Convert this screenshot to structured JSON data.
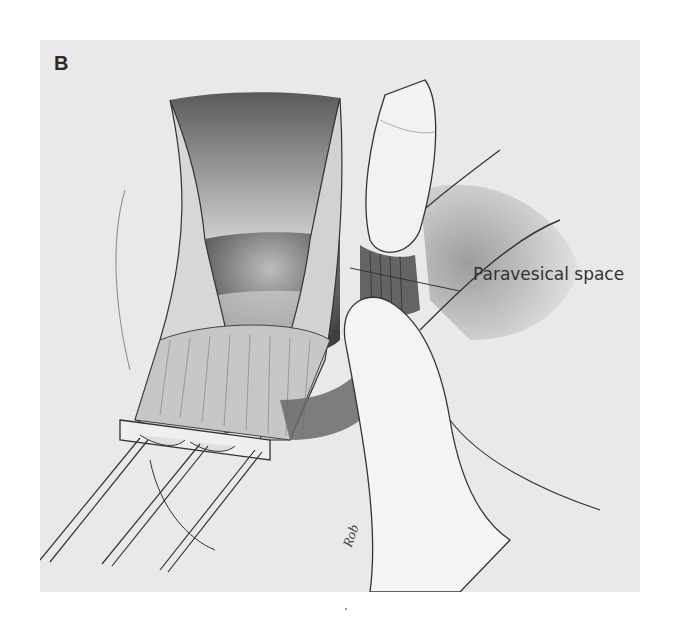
{
  "figure": {
    "panel_label": "B",
    "callouts": [
      {
        "text": "Paravesical space"
      }
    ],
    "signature": "Rob",
    "palette": {
      "paper": "#ffffff",
      "panel_background": "#e9e9e9",
      "line": "#333333",
      "shadow": "#7a7a7a",
      "dark_cavity": "#4a4a4a"
    }
  }
}
